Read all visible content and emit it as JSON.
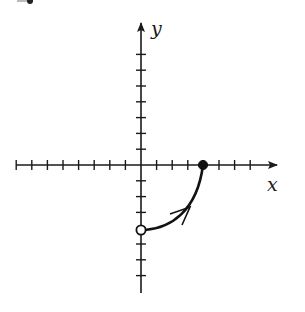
{
  "figure": {
    "top_fragment": "cut-off glyph",
    "axes": {
      "x_label": "x",
      "y_label": "y",
      "x_ticks": [
        -8,
        -7,
        -6,
        -5,
        -4,
        -3,
        -2,
        -1,
        1,
        2,
        3,
        4,
        5,
        6,
        7
      ],
      "y_ticks": [
        -8,
        -7,
        -6,
        -5,
        -4,
        -3,
        -2,
        -1,
        1,
        2,
        3,
        4,
        5,
        6,
        7
      ],
      "x_range": [
        -8,
        8.5
      ],
      "y_range": [
        -8.2,
        9
      ]
    },
    "curve": {
      "description": "Curve from (0,-4) to (4,0), concave up, with direction arrow toward (4,0)",
      "start": {
        "x": 0,
        "y": -4,
        "marker": "open-circle"
      },
      "end": {
        "x": 4,
        "y": 0,
        "marker": "filled-circle"
      },
      "direction": "from start to end",
      "color": "#111111"
    },
    "colors": {
      "axis": "#1a1a1a",
      "background": "#ffffff"
    }
  }
}
